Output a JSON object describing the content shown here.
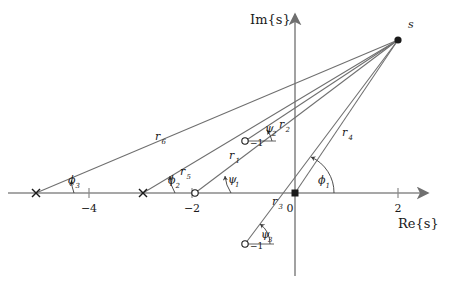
{
  "figure": {
    "type": "pole-zero-plot",
    "axes": {
      "real_axis_label": "Re{s}",
      "imag_axis_label": "Im{s}",
      "origin_label": "0",
      "real_ticks": [
        {
          "label": "−4",
          "value": -4
        },
        {
          "label": "−2",
          "value": -2
        },
        {
          "label": "0",
          "value": 0
        },
        {
          "label": "2",
          "value": 2
        }
      ],
      "imag_ticks": [
        {
          "label": "−1",
          "value": -1
        },
        {
          "label": "−1",
          "value": 1
        }
      ]
    },
    "test_point": {
      "label": "s",
      "re": 2.0,
      "im": 2.85
    },
    "poles": [
      {
        "name": "pole-p3",
        "marker": "x",
        "re": -5.03,
        "im": 0
      },
      {
        "name": "pole-p2",
        "marker": "x",
        "re": -2.95,
        "im": 0
      },
      {
        "name": "pole-p1",
        "marker": "square",
        "re": 0,
        "im": 0
      }
    ],
    "zeros": [
      {
        "name": "zero-z1",
        "marker": "o",
        "re": -1.94,
        "im": 0
      },
      {
        "name": "zero-z2",
        "marker": "o",
        "re": -0.97,
        "im": 1.0
      },
      {
        "name": "zero-z3",
        "marker": "o",
        "re": -0.97,
        "im": -1.0
      }
    ],
    "vectors": [
      {
        "name": "r1",
        "label": "r₁",
        "from": "zero-z1"
      },
      {
        "name": "r2",
        "label": "r₂",
        "from": "zero-z2"
      },
      {
        "name": "r3",
        "label": "r₃",
        "from": "zero-z3"
      },
      {
        "name": "r4",
        "label": "r₄",
        "from": "pole-p1"
      },
      {
        "name": "r5",
        "label": "r₅",
        "from": "pole-p2"
      },
      {
        "name": "r6",
        "label": "r₆",
        "from": "pole-p3"
      }
    ],
    "angles": [
      {
        "name": "psi1",
        "label": "ψ₁",
        "at": "zero-z1"
      },
      {
        "name": "psi2",
        "label": "ψ₂",
        "at": "zero-z2"
      },
      {
        "name": "psi3",
        "label": "ψ₃",
        "at": "zero-z3"
      },
      {
        "name": "phi1",
        "label": "φ₁",
        "at": "pole-p1"
      },
      {
        "name": "phi2",
        "label": "φ₂",
        "at": "pole-p2"
      },
      {
        "name": "phi3",
        "label": "φ₃",
        "at": "pole-p3"
      }
    ]
  },
  "labels": {
    "im_axis": "Im{s}",
    "re_axis": "Re{s}",
    "s_point": "s",
    "origin": "0",
    "tick_m4": "−4",
    "tick_m2": "−2",
    "tick_2": "2",
    "tick_im_top": "−1",
    "tick_im_bottom": "−1",
    "r1": "r",
    "r2": "r",
    "r3": "r",
    "r4": "r",
    "r5": "r",
    "r6": "r",
    "r1_sub": "1",
    "r2_sub": "2",
    "r3_sub": "3",
    "r4_sub": "4",
    "r5_sub": "5",
    "r6_sub": "6",
    "psi": "ψ",
    "phi": "ϕ",
    "psi1_sub": "1",
    "psi2_sub": "2",
    "psi3_sub": "3",
    "phi1_sub": "1",
    "phi2_sub": "2",
    "phi3_sub": "3"
  },
  "colors": {
    "axis": "#8a8a8a",
    "vector": "#6f6f6f",
    "marker": "#1a1a1a",
    "text": "#1a1a1a",
    "background": "#ffffff"
  }
}
